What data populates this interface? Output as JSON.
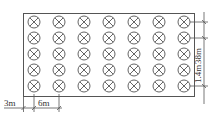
{
  "diagram": {
    "type": "layout-plan",
    "grid": {
      "rows": 5,
      "columns": 7,
      "symbol": "circle-x-icon"
    },
    "dimensions": {
      "edge_offset": "3m",
      "column_spacing": "6m",
      "row_spacing": "1.4m",
      "total_length": "38m"
    },
    "colors": {
      "line": "#444444",
      "background": "#ffffff"
    }
  }
}
